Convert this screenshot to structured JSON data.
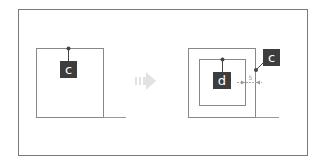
{
  "diagram": {
    "before": {
      "label": "c"
    },
    "arrow": {
      "icon": "right-arrow-icon"
    },
    "after": {
      "inner_label": "d",
      "outer_label": "c",
      "gap_label": "5"
    },
    "colors": {
      "frame": "#7a7a7a",
      "line": "#888888",
      "label_bg": "#3d3d3d",
      "label_text": "#ffffff",
      "arrow": "#e4e4e4",
      "dot": "#444444"
    }
  }
}
